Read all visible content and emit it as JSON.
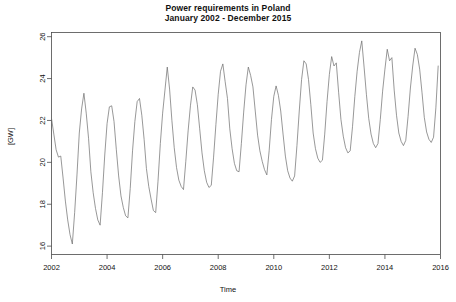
{
  "chart_data": {
    "type": "line",
    "title": "Power requirements in Poland",
    "subtitle": "January 2002 - December 2015",
    "title_line1": "Power requirements in Poland",
    "title_line2": "January 2002 - December 2015",
    "xlabel": "Time",
    "ylabel": "[GW]",
    "xlim": [
      2002.0,
      2016.0
    ],
    "ylim": [
      15.6,
      26.2
    ],
    "xticks": [
      2002,
      2004,
      2006,
      2008,
      2010,
      2012,
      2014,
      2016
    ],
    "xtick_labels": [
      "2002",
      "2004",
      "2006",
      "2008",
      "2010",
      "2012",
      "2014",
      "2016"
    ],
    "yticks": [
      16,
      18,
      20,
      22,
      24,
      26
    ],
    "ytick_labels": [
      "16",
      "18",
      "20",
      "22",
      "24",
      "26"
    ],
    "grid": false,
    "legend": false,
    "line_color": "#6b6b6b",
    "line_width": 0.7,
    "frame": true,
    "x_start": 2002.0,
    "x_step": 0.0833333,
    "series": [
      {
        "name": "Power requirements",
        "units": "GW",
        "frequency": "monthly",
        "n": 168,
        "values": [
          22.1,
          21.35,
          20.6,
          20.25,
          20.3,
          19.25,
          18.15,
          17.25,
          16.55,
          16.1,
          17.6,
          19.4,
          21.4,
          22.55,
          23.3,
          22.35,
          21.15,
          19.55,
          18.55,
          17.8,
          17.25,
          17.0,
          18.55,
          20.35,
          21.85,
          22.65,
          22.7,
          21.95,
          20.6,
          19.35,
          18.4,
          17.85,
          17.45,
          17.35,
          18.75,
          20.55,
          21.95,
          22.9,
          23.05,
          22.25,
          21.1,
          19.7,
          18.85,
          18.25,
          17.7,
          17.6,
          19.1,
          20.9,
          22.35,
          23.45,
          24.55,
          23.5,
          22.0,
          20.7,
          19.75,
          19.15,
          18.85,
          18.7,
          20.05,
          21.5,
          22.7,
          23.6,
          23.45,
          22.75,
          21.6,
          20.45,
          19.6,
          19.05,
          18.8,
          18.9,
          20.25,
          21.8,
          23.25,
          24.35,
          24.7,
          23.85,
          23.05,
          21.6,
          20.65,
          19.95,
          19.6,
          19.55,
          20.9,
          22.4,
          23.7,
          24.55,
          24.15,
          23.6,
          22.45,
          21.3,
          20.55,
          20.05,
          19.65,
          19.4,
          20.55,
          22.05,
          23.15,
          23.65,
          23.2,
          22.45,
          21.35,
          20.3,
          19.6,
          19.25,
          19.1,
          19.35,
          20.8,
          22.45,
          23.95,
          24.85,
          24.7,
          23.95,
          22.75,
          21.4,
          20.65,
          20.2,
          20.0,
          20.1,
          21.35,
          22.9,
          24.2,
          25.05,
          24.6,
          24.75,
          23.35,
          22.05,
          21.25,
          20.7,
          20.45,
          20.55,
          21.7,
          23.15,
          24.35,
          25.25,
          25.8,
          24.55,
          23.25,
          22.1,
          21.35,
          20.9,
          20.7,
          20.9,
          22.05,
          23.4,
          24.45,
          25.4,
          24.85,
          25.0,
          23.45,
          22.25,
          21.4,
          21.0,
          20.8,
          21.05,
          22.2,
          23.55,
          24.6,
          25.45,
          25.15,
          24.45,
          23.35,
          22.15,
          21.45,
          21.1,
          20.95,
          21.2,
          22.6,
          24.6
        ]
      }
    ]
  }
}
